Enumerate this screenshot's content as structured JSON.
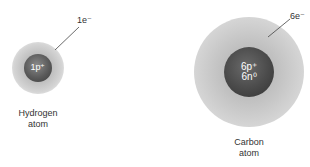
{
  "diagram": {
    "atoms": [
      {
        "name": "Hydrogen atom",
        "label_line1": "Hydrogen",
        "label_line2": "atom",
        "nucleus_label": "1p⁺",
        "electron_label": "1e⁻"
      },
      {
        "name": "Carbon atom",
        "label_line1": "Carbon",
        "label_line2": "atom",
        "nucleus_line1": "6p⁺",
        "nucleus_line2": "6n⁰",
        "electron_label": "6e⁻"
      }
    ],
    "colors": {
      "cloud": "#c8c8c8",
      "nucleus": "#4a4a4a",
      "nucleus_text": "#ffffff",
      "label_text": "#333333"
    }
  }
}
